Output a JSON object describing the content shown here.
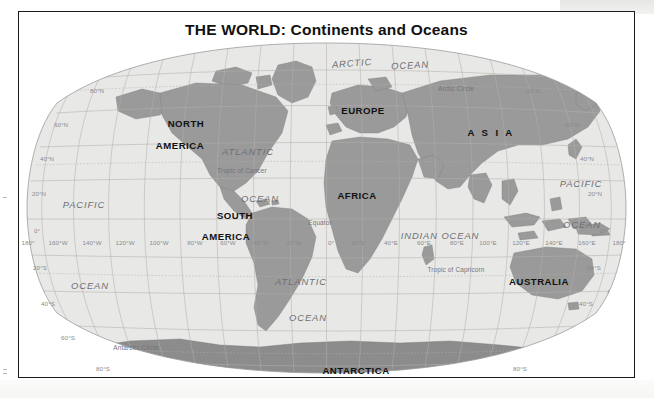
{
  "document": {
    "title": "THE WORLD: Continents and Oceans"
  },
  "map": {
    "projection": "robinson",
    "colors": {
      "ocean": "#e8e9e7",
      "land": "#9a9a9a",
      "land_dark": "#8c8c8c",
      "graticule": "#b9b3ad",
      "frame": "#1a1a1a",
      "label_ocean": "#6e6e72",
      "label_grid": "#8a8a8e"
    },
    "continents": [
      {
        "name": "NORTH",
        "x": 166,
        "y": 82,
        "wide": false
      },
      {
        "name": "AMERICA",
        "x": 160,
        "y": 104,
        "wide": false
      },
      {
        "name": "SOUTH",
        "x": 215,
        "y": 174,
        "wide": false
      },
      {
        "name": "AMERICA",
        "x": 206,
        "y": 195,
        "wide": false
      },
      {
        "name": "EUROPE",
        "x": 343,
        "y": 69,
        "wide": false
      },
      {
        "name": "AFRICA",
        "x": 337,
        "y": 154,
        "wide": false
      },
      {
        "name": "A S I A",
        "x": 471,
        "y": 91,
        "wide": true
      },
      {
        "name": "AUSTRALIA",
        "x": 519,
        "y": 240,
        "wide": false
      },
      {
        "name": "ANTARCTICA",
        "x": 336,
        "y": 329,
        "wide": false
      }
    ],
    "oceans": [
      {
        "name": "ARCTIC",
        "x": 332,
        "y": 22,
        "rot": -4,
        "size": "normal"
      },
      {
        "name": "OCEAN",
        "x": 390,
        "y": 24,
        "rot": -3,
        "size": "normal"
      },
      {
        "name": "PACIFIC",
        "x": 64,
        "y": 163,
        "rot": 0,
        "size": "normal"
      },
      {
        "name": "OCEAN",
        "x": 70,
        "y": 244,
        "rot": 0,
        "size": "normal"
      },
      {
        "name": "ATLANTIC",
        "x": 228,
        "y": 110,
        "rot": 0,
        "size": "normal"
      },
      {
        "name": "OCEAN",
        "x": 240,
        "y": 157,
        "rot": 0,
        "size": "normal"
      },
      {
        "name": "ATLANTIC",
        "x": 281,
        "y": 240,
        "rot": 0,
        "size": "normal"
      },
      {
        "name": "OCEAN",
        "x": 288,
        "y": 276,
        "rot": 0,
        "size": "normal"
      },
      {
        "name": "INDIAN OCEAN",
        "x": 420,
        "y": 194,
        "rot": 0,
        "size": "normal"
      },
      {
        "name": "PACIFIC",
        "x": 561,
        "y": 142,
        "rot": 0,
        "size": "normal"
      },
      {
        "name": "OCEAN",
        "x": 562,
        "y": 183,
        "rot": 0,
        "size": "normal"
      }
    ],
    "reference_lines": [
      {
        "name": "Arctic Circle",
        "x": 436,
        "y": 47
      },
      {
        "name": "Tropic of Cancer",
        "x": 222,
        "y": 129
      },
      {
        "name": "Equator",
        "x": 300,
        "y": 181
      },
      {
        "name": "Tropic of Capricorn",
        "x": 436,
        "y": 228
      },
      {
        "name": "Antarctic Circle",
        "x": 116,
        "y": 306
      }
    ],
    "latitude_labels_left": [
      {
        "label": "80°N",
        "x": 77,
        "y": 49
      },
      {
        "label": "60°N",
        "x": 41,
        "y": 83
      },
      {
        "label": "40°N",
        "x": 27,
        "y": 117
      },
      {
        "label": "20°N",
        "x": 19,
        "y": 152
      },
      {
        "label": "0°",
        "x": 17,
        "y": 189
      },
      {
        "label": "20°S",
        "x": 20,
        "y": 226
      },
      {
        "label": "40°S",
        "x": 28,
        "y": 262
      },
      {
        "label": "60°S",
        "x": 48,
        "y": 296
      },
      {
        "label": "80°S",
        "x": 83,
        "y": 327
      }
    ],
    "latitude_labels_right": [
      {
        "label": "80°N",
        "x": 513,
        "y": 49
      },
      {
        "label": "60°N",
        "x": 552,
        "y": 83
      },
      {
        "label": "40°N",
        "x": 567,
        "y": 117
      },
      {
        "label": "20°N",
        "x": 575,
        "y": 152
      },
      {
        "label": "0°",
        "x": 583,
        "y": 189
      },
      {
        "label": "20°S",
        "x": 574,
        "y": 226
      },
      {
        "label": "40°S",
        "x": 566,
        "y": 262
      },
      {
        "label": "80°S",
        "x": 500,
        "y": 327
      }
    ],
    "longitude_labels": [
      {
        "label": "180°",
        "x": 8
      },
      {
        "label": "160°W",
        "x": 38
      },
      {
        "label": "140°W",
        "x": 72
      },
      {
        "label": "120°W",
        "x": 105
      },
      {
        "label": "100°W",
        "x": 139
      },
      {
        "label": "80°W",
        "x": 175
      },
      {
        "label": "60°W",
        "x": 208
      },
      {
        "label": "40°W",
        "x": 241
      },
      {
        "label": "20°W",
        "x": 274
      },
      {
        "label": "0°",
        "x": 311
      },
      {
        "label": "20°E",
        "x": 338
      },
      {
        "label": "40°E",
        "x": 371
      },
      {
        "label": "60°E",
        "x": 404
      },
      {
        "label": "80°E",
        "x": 437
      },
      {
        "label": "100°E",
        "x": 468
      },
      {
        "label": "120°E",
        "x": 501
      },
      {
        "label": "140°E",
        "x": 534
      },
      {
        "label": "160°E",
        "x": 567
      },
      {
        "label": "180°",
        "x": 599
      }
    ],
    "longitude_label_y": 201
  }
}
